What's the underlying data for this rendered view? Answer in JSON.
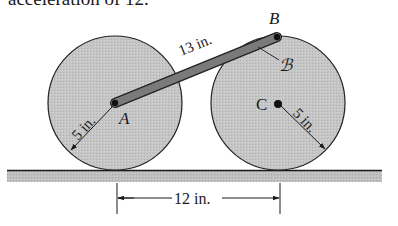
{
  "caption": "acceleration of 12.",
  "labels": {
    "point_a": "A",
    "point_b": "B",
    "point_c": "C",
    "body_b": "ℬ",
    "rod_length": "13 in.",
    "radius_left": "5 in.",
    "radius_right": "5 in.",
    "center_distance": "12 in."
  },
  "colors": {
    "wheel_fill": "#c4c4c4",
    "rod_fill": "#7a7a7a",
    "ground_fill": "#bdbdbd",
    "ink": "#1a1a1a"
  },
  "geometry": {
    "wheel_radius_in": 5,
    "rod_length_in": 13,
    "center_distance_in": 12
  }
}
